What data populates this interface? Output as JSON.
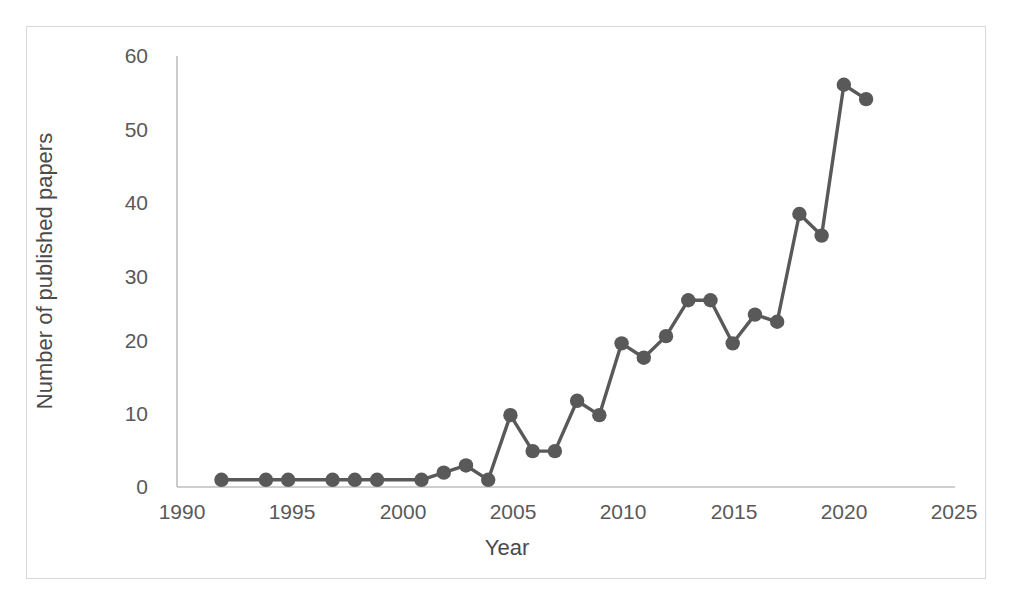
{
  "chart_data": {
    "type": "line",
    "title": "",
    "xlabel": "Year",
    "ylabel": "Number of published papers",
    "xlim": [
      1990,
      2025
    ],
    "ylim": [
      0,
      60
    ],
    "xticks": [
      1990,
      1995,
      2000,
      2005,
      2010,
      2015,
      2020,
      2025
    ],
    "yticks": [
      0,
      10,
      20,
      30,
      40,
      50,
      60
    ],
    "grid": false,
    "legend": null,
    "series_color": "#595959",
    "marker": "circle",
    "series": [
      {
        "name": "Number of published papers",
        "x": [
          1992,
          1994,
          1995,
          1997,
          1998,
          1999,
          2001,
          2002,
          2003,
          2004,
          2005,
          2006,
          2007,
          2008,
          2009,
          2010,
          2011,
          2012,
          2013,
          2014,
          2015,
          2016,
          2017,
          2018,
          2019,
          2020,
          2021
        ],
        "values": [
          1,
          1,
          1,
          1,
          1,
          1,
          1,
          2,
          3,
          1,
          10,
          5,
          5,
          12,
          10,
          20,
          18,
          21,
          26,
          26,
          20,
          24,
          23,
          38,
          35,
          56,
          54
        ]
      }
    ]
  },
  "axes": {
    "x_title": "Year",
    "y_title": "Number of published papers",
    "x_tick_labels": [
      "1990",
      "1995",
      "2000",
      "2005",
      "2010",
      "2015",
      "2020",
      "2025"
    ],
    "y_tick_labels": [
      "0",
      "10",
      "20",
      "30",
      "40",
      "50",
      "60"
    ]
  },
  "colors": {
    "line": "#595959",
    "marker": "#595959",
    "axis": "#bfbfbf",
    "frame": "#d8d8d8",
    "text": "#4a4a4a"
  }
}
